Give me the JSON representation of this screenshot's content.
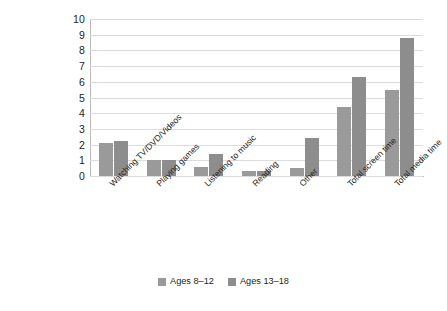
{
  "chart_data": {
    "type": "bar",
    "title": "",
    "subtitle": "",
    "xlabel": "",
    "ylabel": "",
    "ylim": [
      0,
      10
    ],
    "yticks": [
      0,
      1,
      2,
      3,
      4,
      5,
      6,
      7,
      8,
      9,
      10
    ],
    "ytick_labels": [
      "0",
      "1",
      "2",
      "3",
      "4",
      "5",
      "6",
      "7",
      "8",
      "9",
      "10"
    ],
    "grid": true,
    "legend_position": "bottom-center",
    "categories": [
      "Watching TV/DVD/Videos",
      "Playing games",
      "Listening to music",
      "Reading",
      "Other",
      "Total screen time",
      "Total media time"
    ],
    "series": [
      {
        "name": "Ages 8–12",
        "color": "#9a9a9a",
        "values": [
          2.1,
          1.0,
          0.6,
          0.3,
          0.5,
          4.4,
          5.5
        ]
      },
      {
        "name": "Ages 13–18",
        "color": "#8d8d8d",
        "values": [
          2.2,
          1.0,
          1.4,
          0.3,
          2.4,
          6.3,
          8.8
        ]
      }
    ]
  },
  "legend": {
    "items": [
      {
        "label": "Ages 8–12",
        "color": "#9a9a9a"
      },
      {
        "label": "Ages 13–18",
        "color": "#8d8d8d"
      }
    ]
  },
  "colors": {
    "series_1": "#9a9a9a",
    "series_2": "#8d8d8d",
    "gridline": "#dcdcdc",
    "axis": "#b9b9b9",
    "text": "#231f20",
    "background": "#ffffff"
  }
}
